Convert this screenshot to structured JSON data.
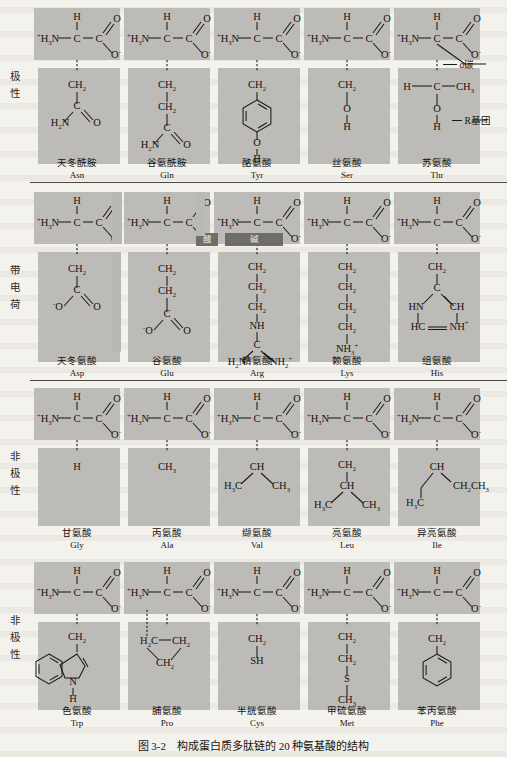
{
  "figure": {
    "caption": "图 3-2　构成蛋白质多肽链的 20 种氨基酸的结构",
    "annotations": {
      "alpha_carbon": "α碳",
      "r_group": "R基团"
    },
    "sub_labels": {
      "acid": "酸",
      "base": "碱"
    }
  },
  "groups": [
    {
      "id": "polar",
      "label_chars": [
        "极",
        "性"
      ]
    },
    {
      "id": "charged",
      "label_chars": [
        "带",
        "电",
        "荷"
      ]
    },
    {
      "id": "nonpolar-1",
      "label_chars": [
        "非",
        "极",
        "性"
      ]
    },
    {
      "id": "nonpolar-2",
      "label_chars": [
        "非",
        "极",
        "性"
      ]
    }
  ],
  "backbone": {
    "amino": "H₃N",
    "amino_charge": "+",
    "alpha_h": "H",
    "alpha_c": "C",
    "carboxyl_c": "C",
    "carbonyl_o": "O",
    "carboxylate_o": "O",
    "carboxylate_charge": "−"
  },
  "amino_acids": [
    {
      "row": 1,
      "col": 1,
      "cn": "天冬酰胺",
      "abbr": "Asn",
      "group": "polar",
      "side_chain_atoms": [
        "CH₂",
        "C",
        "O",
        "H₂N"
      ]
    },
    {
      "row": 1,
      "col": 2,
      "cn": "谷氨酰胺",
      "abbr": "Gln",
      "group": "polar",
      "side_chain_atoms": [
        "CH₂",
        "CH₂",
        "C",
        "O",
        "H₂N"
      ]
    },
    {
      "row": 1,
      "col": 3,
      "cn": "酪氨酸",
      "abbr": "Tyr",
      "group": "polar",
      "side_chain_atoms": [
        "CH₂",
        "benzene-ring",
        "OH"
      ]
    },
    {
      "row": 1,
      "col": 4,
      "cn": "丝氨酸",
      "abbr": "Ser",
      "group": "polar",
      "side_chain_atoms": [
        "CH₂",
        "O",
        "H"
      ]
    },
    {
      "row": 1,
      "col": 5,
      "cn": "苏氨酸",
      "abbr": "Thr",
      "group": "polar",
      "side_chain_atoms": [
        "H",
        "C",
        "CH₃",
        "O",
        "H"
      ]
    },
    {
      "row": 2,
      "col": 1,
      "cn": "天冬氨酸",
      "abbr": "Asp",
      "group": "charged",
      "sub": "酸",
      "side_chain_atoms": [
        "CH₂",
        "C",
        "O",
        "O⁻"
      ]
    },
    {
      "row": 2,
      "col": 2,
      "cn": "谷氨酸",
      "abbr": "Glu",
      "group": "charged",
      "sub": "酸",
      "side_chain_atoms": [
        "CH₂",
        "CH₂",
        "C",
        "O",
        "O⁻"
      ]
    },
    {
      "row": 2,
      "col": 3,
      "cn": "精氨酸",
      "abbr": "Arg",
      "group": "charged",
      "sub": "碱",
      "side_chain_atoms": [
        "CH₂",
        "CH₂",
        "CH₂",
        "NH",
        "C",
        "H₂N",
        "NH₂⁺"
      ]
    },
    {
      "row": 2,
      "col": 4,
      "cn": "赖氨酸",
      "abbr": "Lys",
      "group": "charged",
      "sub": "碱",
      "side_chain_atoms": [
        "CH₂",
        "CH₂",
        "CH₂",
        "CH₂",
        "NH₃⁺"
      ]
    },
    {
      "row": 2,
      "col": 5,
      "cn": "组氨酸",
      "abbr": "His",
      "group": "charged",
      "sub": "碱",
      "side_chain_atoms": [
        "CH₂",
        "C",
        "HN",
        "CH",
        "HC",
        "NH⁺"
      ]
    },
    {
      "row": 3,
      "col": 1,
      "cn": "甘氨酸",
      "abbr": "Gly",
      "group": "nonpolar-1",
      "side_chain_atoms": [
        "H"
      ]
    },
    {
      "row": 3,
      "col": 2,
      "cn": "丙氨酸",
      "abbr": "Ala",
      "group": "nonpolar-1",
      "side_chain_atoms": [
        "CH₃"
      ]
    },
    {
      "row": 3,
      "col": 3,
      "cn": "缬氨酸",
      "abbr": "Val",
      "group": "nonpolar-1",
      "side_chain_atoms": [
        "CH",
        "H₃C",
        "CH₃"
      ]
    },
    {
      "row": 3,
      "col": 4,
      "cn": "亮氨酸",
      "abbr": "Leu",
      "group": "nonpolar-1",
      "side_chain_atoms": [
        "CH₂",
        "CH",
        "H₃C",
        "CH₃"
      ]
    },
    {
      "row": 3,
      "col": 5,
      "cn": "异亮氨酸",
      "abbr": "Ile",
      "group": "nonpolar-1",
      "side_chain_atoms": [
        "CH",
        "CH₂",
        "CH₃",
        "H₃C"
      ]
    },
    {
      "row": 4,
      "col": 1,
      "cn": "色氨酸",
      "abbr": "Trp",
      "group": "nonpolar-2",
      "side_chain_atoms": [
        "CH₂",
        "indole-ring",
        "N",
        "H"
      ]
    },
    {
      "row": 4,
      "col": 2,
      "cn": "脯氨酸",
      "abbr": "Pro",
      "group": "nonpolar-2",
      "side_chain_atoms": [
        "H₂C",
        "CH₂",
        "CH₂"
      ]
    },
    {
      "row": 4,
      "col": 3,
      "cn": "半胱氨酸",
      "abbr": "Cys",
      "group": "nonpolar-2",
      "side_chain_atoms": [
        "CH₂",
        "SH"
      ]
    },
    {
      "row": 4,
      "col": 4,
      "cn": "甲硫氨酸",
      "abbr": "Met",
      "group": "nonpolar-2",
      "side_chain_atoms": [
        "CH₂",
        "CH₂",
        "S",
        "CH₃"
      ]
    },
    {
      "row": 4,
      "col": 5,
      "cn": "苯丙氨酸",
      "abbr": "Phe",
      "group": "nonpolar-2",
      "side_chain_atoms": [
        "CH₂",
        "benzene-ring"
      ]
    }
  ],
  "colors": {
    "page": "#f4f2ed",
    "cell_box": "#bcbbb7",
    "dark_bar": "#6f6d69",
    "ink": "#16140f"
  }
}
